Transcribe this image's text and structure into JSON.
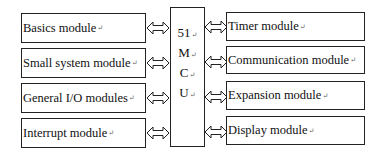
{
  "center": {
    "lines": [
      "51",
      "M",
      "C",
      "U"
    ],
    "return_mark": "↵"
  },
  "left_modules": [
    {
      "label": "Basics module"
    },
    {
      "label": "Small system module"
    },
    {
      "label": "General I/O modules"
    },
    {
      "label": "Interrupt module"
    }
  ],
  "right_modules": [
    {
      "label": "Timer module"
    },
    {
      "label": "Communication module"
    },
    {
      "label": "Expansion module"
    },
    {
      "label": "Display module"
    }
  ],
  "return_mark": "↵"
}
